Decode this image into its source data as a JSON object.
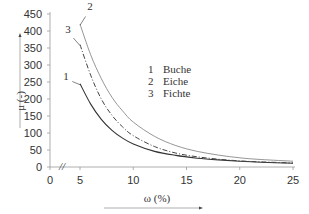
{
  "chart_data": {
    "type": "line",
    "title": "",
    "xlabel": "ω (%)",
    "ylabel": "μ (-)",
    "xlim": [
      0,
      25
    ],
    "ylim": [
      0,
      450
    ],
    "x_ticks": [
      "0",
      "5",
      "10",
      "15",
      "20",
      "25"
    ],
    "y_ticks": [
      "0",
      "50",
      "100",
      "150",
      "200",
      "250",
      "300",
      "350",
      "400",
      "450"
    ],
    "grid": false,
    "axis_break": {
      "axis": "x",
      "between": [
        0,
        5
      ],
      "symbol": "//"
    },
    "legend_position": "upper-right-inside",
    "legend": [
      {
        "id": "1",
        "label": "Buche"
      },
      {
        "id": "2",
        "label": "Eiche"
      },
      {
        "id": "3",
        "label": "Fichte"
      }
    ],
    "x": [
      5,
      6,
      7,
      8,
      9,
      10,
      12,
      14,
      16,
      18,
      20,
      22,
      25
    ],
    "series": [
      {
        "name": "1 Buche",
        "style": "solid-dark",
        "values": [
          245,
          185,
          140,
          108,
          85,
          68,
          46,
          34,
          26,
          21,
          17,
          14,
          11
        ]
      },
      {
        "name": "2 Eiche",
        "style": "solid-light",
        "values": [
          420,
          330,
          260,
          205,
          165,
          132,
          90,
          63,
          46,
          35,
          27,
          22,
          17
        ]
      },
      {
        "name": "3 Fichte",
        "style": "dash-dot",
        "values": [
          360,
          270,
          200,
          152,
          118,
          92,
          60,
          41,
          30,
          23,
          18,
          15,
          12
        ]
      }
    ],
    "curve_labels": [
      {
        "text": "1",
        "series": "1 Buche"
      },
      {
        "text": "2",
        "series": "2 Eiche"
      },
      {
        "text": "3",
        "series": "3 Fichte"
      }
    ],
    "colors": {
      "axis": "#9a9a9a",
      "text": "#333333",
      "buche": "#333333",
      "eiche": "#8a8a8a",
      "fichte": "#444444"
    }
  }
}
